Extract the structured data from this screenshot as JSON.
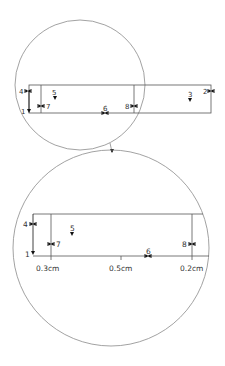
{
  "diagram": {
    "colors": {
      "line": "#555555",
      "circle": "#8a8a8a",
      "marker": "#111111",
      "text": "#333333"
    },
    "overview": {
      "markers": [
        {
          "id": "1",
          "label": "1",
          "type": "arrow-down"
        },
        {
          "id": "2",
          "label": "2",
          "type": "width-handle"
        },
        {
          "id": "3",
          "label": "3",
          "type": "arrow-down"
        },
        {
          "id": "4",
          "label": "4",
          "type": "width-handle"
        },
        {
          "id": "5",
          "label": "5",
          "type": "arrow-down"
        },
        {
          "id": "6",
          "label": "6",
          "type": "width-handle"
        },
        {
          "id": "7",
          "label": "7",
          "type": "width-handle"
        },
        {
          "id": "8",
          "label": "8",
          "type": "width-handle"
        }
      ]
    },
    "magnified": {
      "markers": [
        {
          "id": "1",
          "label": "1"
        },
        {
          "id": "4",
          "label": "4"
        },
        {
          "id": "5",
          "label": "5"
        },
        {
          "id": "6",
          "label": "6"
        },
        {
          "id": "7",
          "label": "7"
        },
        {
          "id": "8",
          "label": "8"
        }
      ],
      "dimensions": [
        {
          "label": "0.3cm"
        },
        {
          "label": "0.5cm"
        },
        {
          "label": "0.2cm"
        }
      ]
    }
  }
}
